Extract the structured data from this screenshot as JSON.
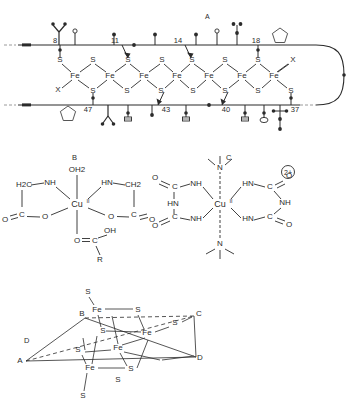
{
  "figure": {
    "background_color": "#ffffff",
    "line_color": "#2b2b2b",
    "panels": [
      "A",
      "B",
      "C",
      "D"
    ]
  },
  "panel_a": {
    "label": "A",
    "description": "Polypeptide chain schematic with iron-sulfur chain",
    "top_residue_numbers": [
      "8",
      "11",
      "14",
      "18"
    ],
    "bottom_residue_numbers": [
      "47",
      "43",
      "40",
      "37"
    ],
    "chain_atoms": {
      "fe_label": "Fe",
      "s_label": "S",
      "x_label": "X",
      "fe_count": 7,
      "bridge_s_count": 6
    },
    "terminal_ligands": [
      "X",
      "X"
    ],
    "top_sidechain_glyphs": [
      "stick-circle",
      "branched-y",
      "stick-circle",
      "stick-dot",
      "stick-dot",
      "stick-circle",
      "stick-double-dot",
      "ring-pentagon"
    ],
    "bottom_sidechain_glyphs": [
      "ring-pentagon",
      "branched-a",
      "stick-bar",
      "stick-dot",
      "stick-bar",
      "stick-bar",
      "stick-ring",
      "stick-cross-dot"
    ]
  },
  "panel_b": {
    "label": "B",
    "description": "Copper(II) bis-glycinate complex with axial water and carboxylic acid",
    "metal": "Cu",
    "metal_oxidation": "II",
    "axial_top": "OH2",
    "left_arm": {
      "ch2": "H2C",
      "nh": "NH",
      "carbonyl_o": "O",
      "ester_o": "O",
      "c": "C"
    },
    "right_arm": {
      "ch2": "CH2",
      "nh": "HN",
      "carbonyl_o": "O",
      "ester_o": "O",
      "c": "C"
    },
    "axial_bottom": {
      "o": "O",
      "c": "C",
      "oh": "OH",
      "r": "R"
    }
  },
  "panel_c": {
    "label": "C",
    "description": "Copper(II) biuret complex cation with axial amine ligands",
    "metal": "Cu",
    "metal_oxidation": "II",
    "charge": "2+",
    "axial_top_n": "N",
    "axial_bottom_n": "N",
    "left_ligand": {
      "nh_upper": "NH",
      "nh_lower": "NH",
      "c_upper": "C",
      "c_lower": "C",
      "o_upper": "O",
      "o_lower": "O",
      "hn": "HN"
    },
    "right_ligand": {
      "hn_upper": "HN",
      "hn_lower": "HN",
      "c_upper": "C",
      "c_lower": "C",
      "nh_mid": "NH",
      "o_upper": "O",
      "o_lower": "O"
    }
  },
  "panel_d": {
    "label": "D",
    "description": "Fe4S4 cubane cluster inside a distorted tetrahedron",
    "vertices": [
      "A",
      "B",
      "C",
      "D"
    ],
    "fe_label": "Fe",
    "s_label": "S",
    "fe_count": 4,
    "s_core_count": 4,
    "s_terminal_count": 4
  }
}
